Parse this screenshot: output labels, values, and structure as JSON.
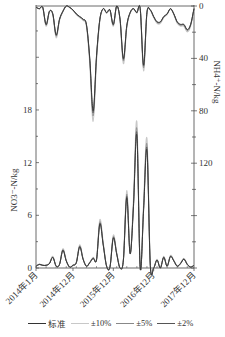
{
  "chart_data": {
    "type": "line",
    "title": "",
    "x_ticks": [
      "2014年1月",
      "2014年12月",
      "2015年12月",
      "2016年12月",
      "2017年12月"
    ],
    "x_range": [
      "2014-01",
      "2017-12"
    ],
    "left_axis": {
      "label": "NO3⁻-N/kg",
      "ticks": [
        0,
        6,
        12,
        18
      ],
      "range": [
        0,
        30
      ]
    },
    "right_axis": {
      "label": "NH4⁺-N/kg",
      "ticks": [
        0,
        40,
        80,
        120
      ],
      "range": [
        0,
        200
      ],
      "inverted": true
    },
    "legend": [
      {
        "name": "标准",
        "color": "#333333"
      },
      {
        "name": "±10%",
        "color": "#c8c8c8"
      },
      {
        "name": "±5%",
        "color": "#888888"
      },
      {
        "name": "±2%",
        "color": "#555555"
      }
    ],
    "months": [
      "2014-01",
      "2014-02",
      "2014-03",
      "2014-04",
      "2014-05",
      "2014-06",
      "2014-07",
      "2014-08",
      "2014-09",
      "2014-10",
      "2014-11",
      "2014-12",
      "2015-01",
      "2015-02",
      "2015-03",
      "2015-04",
      "2015-05",
      "2015-06",
      "2015-07",
      "2015-08",
      "2015-09",
      "2015-10",
      "2015-11",
      "2015-12",
      "2016-01",
      "2016-02",
      "2016-03",
      "2016-04",
      "2016-05",
      "2016-06",
      "2016-07",
      "2016-08",
      "2016-09",
      "2016-10",
      "2016-11",
      "2016-12",
      "2017-01",
      "2017-02",
      "2017-03",
      "2017-04",
      "2017-05",
      "2017-06",
      "2017-07",
      "2017-08",
      "2017-09",
      "2017-10",
      "2017-11",
      "2017-12"
    ],
    "series": [
      {
        "name": "NO3⁻-N 标准",
        "axis": "left",
        "values": [
          0.2,
          0.4,
          0.3,
          0.3,
          0.5,
          1.2,
          0.2,
          0.4,
          2.0,
          0.8,
          0.1,
          0.3,
          0.6,
          2.4,
          1.0,
          0.2,
          0.6,
          1.1,
          0.9,
          5.0,
          2.6,
          0.2,
          0.1,
          3.4,
          1.6,
          0.0,
          0.9,
          8.0,
          1.6,
          7.0,
          15.1,
          0.0,
          6.5,
          13.4,
          0.3,
          0.0,
          0.9,
          0.0,
          1.2,
          0.2,
          1.3,
          0.8,
          0.2,
          0.5,
          1.0,
          0.4,
          0.1,
          0.3
        ]
      },
      {
        "name": "NH4⁺-N 标准",
        "axis": "right",
        "values": [
          1,
          2,
          1,
          14,
          4,
          6,
          22,
          10,
          4,
          0,
          1,
          3,
          6,
          8,
          10,
          14,
          40,
          80,
          38,
          10,
          2,
          5,
          3,
          14,
          0,
          10,
          40,
          15,
          5,
          2,
          5,
          2,
          45,
          5,
          3,
          8,
          12,
          12,
          8,
          6,
          2,
          6,
          12,
          14,
          14,
          18,
          14,
          2
        ]
      }
    ]
  },
  "legend": {
    "items": [
      {
        "label": "标准"
      },
      {
        "label": "±10%"
      },
      {
        "label": "±5%"
      },
      {
        "label": "±2%"
      }
    ]
  },
  "axes": {
    "left_title": "NO3⁻-N/kg",
    "right_title": "NH4⁺-N/kg",
    "left_ticks": [
      "0",
      "6",
      "12",
      "18"
    ],
    "right_ticks": [
      "0",
      "40",
      "80",
      "120"
    ],
    "x_ticks": [
      "2014年1月",
      "2014年12月",
      "2015年12月",
      "2016年12月",
      "2017年12月"
    ]
  }
}
